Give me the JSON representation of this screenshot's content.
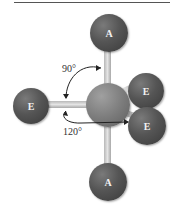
{
  "diagram": {
    "type": "trigonal bipyramidal molecular geometry",
    "atoms": {
      "axial_top": "A",
      "axial_bottom": "A",
      "equatorial_left": "E",
      "equatorial_upper_right": "E",
      "equatorial_lower_right": "E"
    },
    "angles": {
      "axial_equatorial": "90°",
      "equatorial_equatorial": "120°"
    },
    "colors": {
      "atom": "#4a4a4a",
      "center_atom": "#7d7d7d",
      "bond": "#cfcfcf",
      "text": "#333333"
    }
  }
}
